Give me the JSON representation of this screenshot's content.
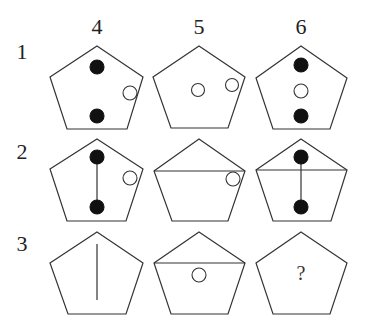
{
  "columns": [
    {
      "label": "4",
      "x": 97
    },
    {
      "label": "5",
      "x": 199
    },
    {
      "label": "6",
      "x": 301
    }
  ],
  "rows": [
    {
      "label": "1",
      "y": 52
    },
    {
      "label": "2",
      "y": 152
    },
    {
      "label": "3",
      "y": 244
    }
  ],
  "colors": {
    "stroke": "#333333",
    "filled_dot": "#111111",
    "empty_dot": "#ffffff",
    "background": "#ffffff"
  },
  "cells": [
    {
      "row": 1,
      "col": 4,
      "pentagon": [
        [
          97,
          46
        ],
        [
          143,
          77
        ],
        [
          127,
          129
        ],
        [
          67,
          129
        ],
        [
          50,
          77
        ]
      ],
      "lines": [],
      "dots": [
        {
          "x": 97,
          "y": 67,
          "r": 7,
          "filled": true
        },
        {
          "x": 97,
          "y": 116,
          "r": 7,
          "filled": true
        },
        {
          "x": 130,
          "y": 93,
          "r": 7,
          "filled": false
        }
      ]
    },
    {
      "row": 1,
      "col": 5,
      "pentagon": [
        [
          199,
          46
        ],
        [
          245,
          77
        ],
        [
          228,
          128
        ],
        [
          171,
          128
        ],
        [
          153,
          77
        ]
      ],
      "lines": [],
      "dots": [
        {
          "x": 198,
          "y": 90,
          "r": 6.5,
          "filled": false
        },
        {
          "x": 232,
          "y": 85,
          "r": 6.5,
          "filled": false
        }
      ]
    },
    {
      "row": 1,
      "col": 6,
      "pentagon": [
        [
          301,
          46
        ],
        [
          347,
          78
        ],
        [
          330,
          129
        ],
        [
          273,
          129
        ],
        [
          256,
          78
        ]
      ],
      "lines": [],
      "dots": [
        {
          "x": 301,
          "y": 65,
          "r": 7,
          "filled": true
        },
        {
          "x": 301,
          "y": 91,
          "r": 7,
          "filled": false
        },
        {
          "x": 301,
          "y": 116,
          "r": 7,
          "filled": true
        }
      ]
    },
    {
      "row": 2,
      "col": 4,
      "pentagon": [
        [
          97,
          139
        ],
        [
          143,
          169
        ],
        [
          126,
          221
        ],
        [
          67,
          221
        ],
        [
          50,
          169
        ]
      ],
      "lines": [
        [
          97,
          157,
          97,
          207
        ]
      ],
      "dots": [
        {
          "x": 97,
          "y": 157,
          "r": 7,
          "filled": true
        },
        {
          "x": 97,
          "y": 207,
          "r": 7,
          "filled": true
        },
        {
          "x": 130,
          "y": 178,
          "r": 7,
          "filled": false
        }
      ]
    },
    {
      "row": 2,
      "col": 5,
      "pentagon": [
        [
          199,
          139
        ],
        [
          245,
          171
        ],
        [
          228,
          221
        ],
        [
          172,
          221
        ],
        [
          154,
          171
        ]
      ],
      "lines": [
        [
          154,
          171,
          245,
          171
        ]
      ],
      "dots": [
        {
          "x": 233,
          "y": 179,
          "r": 7,
          "filled": false
        }
      ]
    },
    {
      "row": 2,
      "col": 6,
      "pentagon": [
        [
          301,
          139
        ],
        [
          347,
          170
        ],
        [
          331,
          221
        ],
        [
          273,
          221
        ],
        [
          256,
          170
        ]
      ],
      "lines": [
        [
          256,
          170,
          347,
          170
        ],
        [
          301,
          157,
          301,
          207
        ]
      ],
      "dots": [
        {
          "x": 301,
          "y": 157,
          "r": 7,
          "filled": true
        },
        {
          "x": 301,
          "y": 207,
          "r": 7,
          "filled": true
        }
      ]
    },
    {
      "row": 3,
      "col": 4,
      "pentagon": [
        [
          97,
          232
        ],
        [
          143,
          263
        ],
        [
          126,
          314
        ],
        [
          68,
          314
        ],
        [
          50,
          263
        ]
      ],
      "lines": [
        [
          97,
          244,
          97,
          300
        ]
      ],
      "dots": []
    },
    {
      "row": 3,
      "col": 5,
      "pentagon": [
        [
          199,
          232
        ],
        [
          245,
          263
        ],
        [
          228,
          314
        ],
        [
          171,
          314
        ],
        [
          154,
          263
        ]
      ],
      "lines": [
        [
          154,
          263,
          245,
          263
        ]
      ],
      "dots": [
        {
          "x": 199,
          "y": 275,
          "r": 7,
          "filled": false
        }
      ]
    },
    {
      "row": 3,
      "col": 6,
      "pentagon": [
        [
          301,
          232
        ],
        [
          347,
          263
        ],
        [
          330,
          314
        ],
        [
          273,
          314
        ],
        [
          256,
          263
        ]
      ],
      "lines": [],
      "dots": [],
      "text": {
        "value": "?",
        "x": 301,
        "y": 273
      }
    }
  ]
}
